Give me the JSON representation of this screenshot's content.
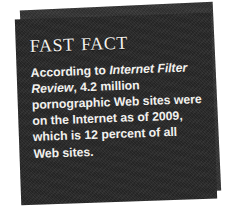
{
  "graphic": {
    "kind": "fast-fact-callout-box",
    "title": "Fast Fact",
    "body": {
      "lead": "According to ",
      "source_italic": "Internet Filter Review",
      "rest": ", 4.2 million pornographic Web sites were on the Internet as of 2009, which is 12 percent of all Web sites.",
      "full_text": "According to Internet Filter Review, 4.2 million pornographic Web sites were on the Internet as of 2009, which is 12 percent of all Web sites.",
      "lines": [
        "According to Internet Filter",
        "Review, 4.2 million porno-",
        "graphic Web sites were on",
        "the Internet as of 2009,",
        "which is 12 percent of all",
        "Web sites."
      ]
    },
    "figures": {
      "site_count": "4.2 million",
      "year": "2009",
      "share_percent": "12 percent"
    },
    "colors": {
      "page_background": "#ffffff",
      "card_front": "#282828",
      "card_back": "#343434",
      "text": "#f2f1ee",
      "title_text": "#f4f2ee"
    }
  }
}
